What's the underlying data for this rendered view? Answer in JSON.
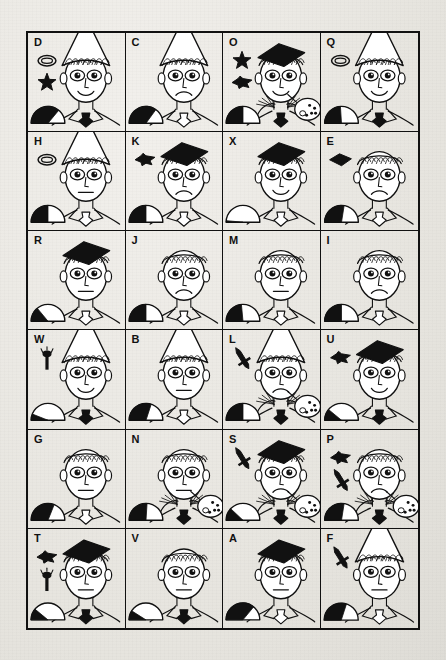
{
  "page": {
    "background_color": "#e9e7e2",
    "ink_color": "#111111",
    "grid": {
      "columns": 4,
      "rows": 6,
      "total_cells": 24
    }
  },
  "legend": {
    "hat_types": [
      "cone",
      "mortarboard",
      "none"
    ],
    "mouth_types": [
      "smile",
      "neutral",
      "frown"
    ],
    "tie_colors": [
      "black",
      "white"
    ],
    "collar_types": [
      "plain",
      "ruffled"
    ],
    "icon_names": [
      "ring-icon",
      "star-icon",
      "diamond-icon",
      "sword-icon",
      "torch-icon",
      "mortarboard-icon"
    ],
    "gauge_name": "dome-gauge"
  },
  "cells": [
    {
      "label": "D",
      "hat": "cone",
      "mouth": "smile",
      "tie": "black",
      "collar": "plain",
      "palette": false,
      "icons": [
        "ring-icon",
        "star-icon"
      ],
      "gauge_fill": 0.72,
      "gauge_shape": "dome"
    },
    {
      "label": "C",
      "hat": "cone",
      "mouth": "frown",
      "tie": "white",
      "collar": "plain",
      "palette": false,
      "icons": [],
      "gauge_fill": 0.7,
      "gauge_shape": "dome"
    },
    {
      "label": "O",
      "hat": "mortarboard",
      "mouth": "smile",
      "tie": "black",
      "collar": "ruffled",
      "palette": true,
      "icons": [
        "star-icon",
        "diamond-icon"
      ],
      "gauge_fill": 0.5,
      "gauge_shape": "dome"
    },
    {
      "label": "Q",
      "hat": "cone",
      "mouth": "smile",
      "tie": "black",
      "collar": "plain",
      "palette": false,
      "icons": [
        "ring-icon"
      ],
      "gauge_fill": 0.48,
      "gauge_shape": "dome"
    },
    {
      "label": "H",
      "hat": "cone",
      "mouth": "neutral",
      "tie": "white",
      "collar": "plain",
      "palette": false,
      "icons": [
        "ring-icon"
      ],
      "gauge_fill": 0.5,
      "gauge_shape": "dome"
    },
    {
      "label": "K",
      "hat": "mortarboard",
      "mouth": "frown",
      "tie": "white",
      "collar": "plain",
      "palette": false,
      "icons": [
        "diamond-icon"
      ],
      "gauge_fill": 0.5,
      "gauge_shape": "dome"
    },
    {
      "label": "X",
      "hat": "mortarboard",
      "mouth": "smile",
      "tie": "white",
      "collar": "plain",
      "palette": false,
      "icons": [],
      "gauge_fill": 0.03,
      "gauge_shape": "dome"
    },
    {
      "label": "E",
      "hat": "none",
      "mouth": "frown",
      "tie": "white",
      "collar": "plain",
      "palette": false,
      "icons": [
        "mortarboard-icon"
      ],
      "gauge_fill": 0.55,
      "gauge_shape": "dome"
    },
    {
      "label": "R",
      "hat": "mortarboard",
      "mouth": "neutral",
      "tie": "white",
      "collar": "plain",
      "palette": false,
      "icons": [],
      "gauge_fill": 0.28,
      "gauge_shape": "dome"
    },
    {
      "label": "J",
      "hat": "none",
      "mouth": "frown",
      "tie": "white",
      "collar": "plain",
      "palette": false,
      "icons": [],
      "gauge_fill": 0.5,
      "gauge_shape": "dome"
    },
    {
      "label": "M",
      "hat": "none",
      "mouth": "neutral",
      "tie": "white",
      "collar": "plain",
      "palette": false,
      "icons": [],
      "gauge_fill": 0.47,
      "gauge_shape": "dome"
    },
    {
      "label": "I",
      "hat": "none",
      "mouth": "frown",
      "tie": "white",
      "collar": "plain",
      "palette": false,
      "icons": [],
      "gauge_fill": 0.5,
      "gauge_shape": "dome"
    },
    {
      "label": "W",
      "hat": "cone",
      "mouth": "smile",
      "tie": "black",
      "collar": "plain",
      "palette": false,
      "icons": [
        "torch-icon"
      ],
      "gauge_fill": 0.12,
      "gauge_shape": "dome"
    },
    {
      "label": "B",
      "hat": "cone",
      "mouth": "neutral",
      "tie": "white",
      "collar": "plain",
      "palette": false,
      "icons": [],
      "gauge_fill": 0.6,
      "gauge_shape": "dome"
    },
    {
      "label": "L",
      "hat": "cone",
      "mouth": "frown",
      "tie": "black",
      "collar": "ruffled",
      "palette": true,
      "icons": [
        "sword-icon"
      ],
      "gauge_fill": 0.5,
      "gauge_shape": "dome"
    },
    {
      "label": "U",
      "hat": "mortarboard",
      "mouth": "smile",
      "tie": "black",
      "collar": "plain",
      "palette": false,
      "icons": [
        "diamond-icon"
      ],
      "gauge_fill": 0.22,
      "gauge_shape": "dome"
    },
    {
      "label": "G",
      "hat": "none",
      "mouth": "neutral",
      "tie": "white",
      "collar": "plain",
      "palette": false,
      "icons": [],
      "gauge_fill": 0.62,
      "gauge_shape": "dome"
    },
    {
      "label": "N",
      "hat": "none",
      "mouth": "neutral",
      "tie": "black",
      "collar": "ruffled",
      "palette": true,
      "icons": [],
      "gauge_fill": 0.52,
      "gauge_shape": "dome"
    },
    {
      "label": "S",
      "hat": "mortarboard",
      "mouth": "frown",
      "tie": "black",
      "collar": "ruffled",
      "palette": true,
      "icons": [
        "sword-icon"
      ],
      "gauge_fill": 0.24,
      "gauge_shape": "dome"
    },
    {
      "label": "P",
      "hat": "none",
      "mouth": "frown",
      "tie": "black",
      "collar": "ruffled",
      "palette": true,
      "icons": [
        "diamond-icon",
        "sword-icon"
      ],
      "gauge_fill": 0.55,
      "gauge_shape": "dome"
    },
    {
      "label": "T",
      "hat": "mortarboard",
      "mouth": "neutral",
      "tie": "black",
      "collar": "plain",
      "palette": false,
      "icons": [
        "diamond-icon",
        "torch-icon"
      ],
      "gauge_fill": 0.22,
      "gauge_shape": "dome"
    },
    {
      "label": "V",
      "hat": "none",
      "mouth": "neutral",
      "tie": "black",
      "collar": "plain",
      "palette": false,
      "icons": [],
      "gauge_fill": 0.18,
      "gauge_shape": "dome"
    },
    {
      "label": "A",
      "hat": "mortarboard",
      "mouth": "neutral",
      "tie": "white",
      "collar": "plain",
      "palette": false,
      "icons": [],
      "gauge_fill": 0.72,
      "gauge_shape": "dome"
    },
    {
      "label": "F",
      "hat": "cone",
      "mouth": "neutral",
      "tie": "white",
      "collar": "plain",
      "palette": false,
      "icons": [
        "sword-icon"
      ],
      "gauge_fill": 0.6,
      "gauge_shape": "dome"
    }
  ]
}
